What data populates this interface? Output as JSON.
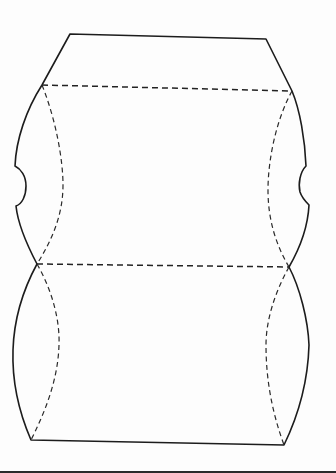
{
  "diagram": {
    "type": "pillow-box-template",
    "colors": {
      "paper": "#fdfdfd",
      "cut_line": "#1c1c1c",
      "fold_line": "#222222",
      "border": "#2b2b2b"
    },
    "key_points": {
      "top_left": [
        70,
        34
      ],
      "top_right": [
        266,
        39
      ],
      "upper_fold_left": [
        42,
        85
      ],
      "upper_fold_right": [
        292,
        91
      ],
      "middle_fold_left": [
        37,
        264
      ],
      "middle_fold_right": [
        289,
        267
      ],
      "bottom_left": [
        31,
        440
      ],
      "bottom_right": [
        284,
        445
      ]
    },
    "paths": {
      "outline": "M70,34 L266,39 L292,91 C300,110 305,140 306,166 C300,172 298,184 300,192 C302,198 306,202 309,205 C308,225 300,248 289,267 C300,288 308,320 309,345 C308,380 300,412 284,445 L31,440 C18,410 12,380 13,350 C14,318 24,288 37,264 C27,245 18,225 16,206 C22,204 26,196 26,186 C26,176 21,169 15,166 C16,140 26,110 42,85 Z",
      "upper_fold": "M42,85 L292,91",
      "middle_fold": "M37,264 L289,267",
      "left_upper_curve": "M42,85 C56,120 63,160 63,185 C63,215 52,240 37,264",
      "right_upper_curve": "M292,91 C276,120 268,160 268,190 C268,220 276,245 289,267",
      "left_lower_curve": "M37,264 C52,290 60,320 59,345 C58,380 45,412 31,440",
      "right_lower_curve": "M289,267 C275,292 266,320 266,345 C266,380 272,412 284,445"
    }
  }
}
